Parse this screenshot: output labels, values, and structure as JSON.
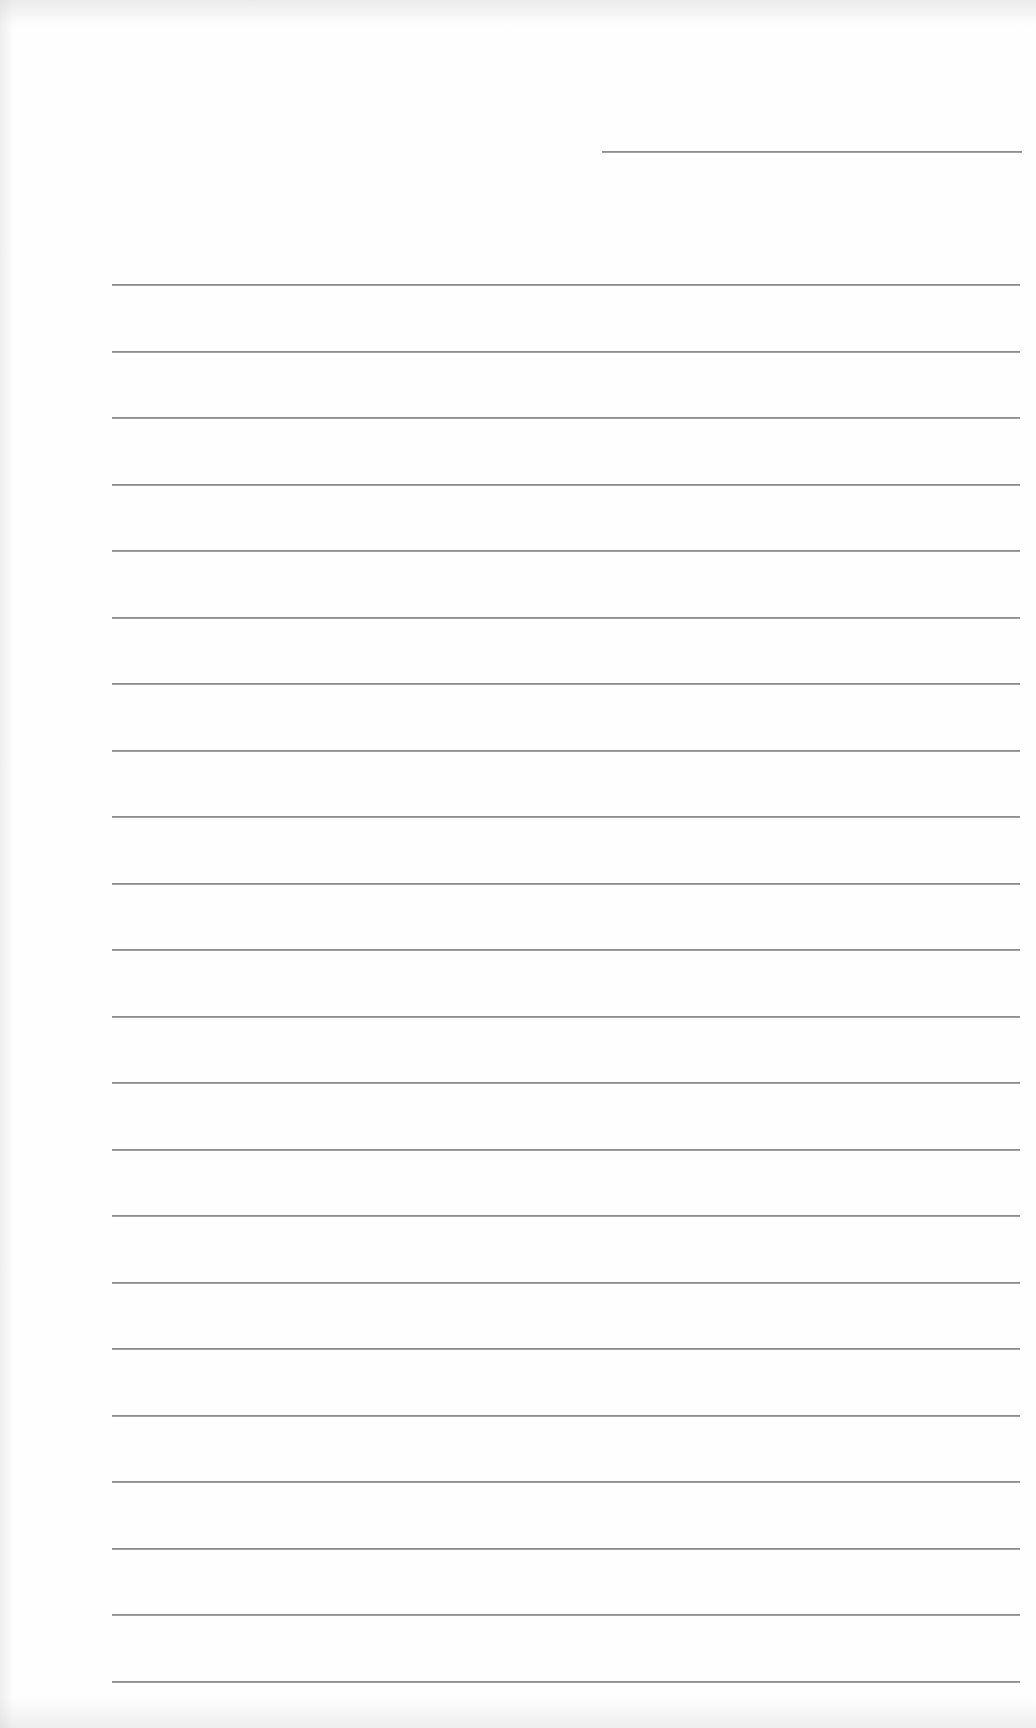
{
  "document": {
    "type": "blank lined sheet",
    "text_content": "",
    "header_rule": {
      "x_start": 602,
      "x_end": 1022,
      "y": 151
    },
    "body_rules": {
      "count": 22,
      "x_start": 112,
      "x_end": 1020,
      "y_first": 284,
      "spacing": 66.5
    },
    "colors": {
      "paper": "#fefefe",
      "rule": "#8e8e8e"
    }
  }
}
